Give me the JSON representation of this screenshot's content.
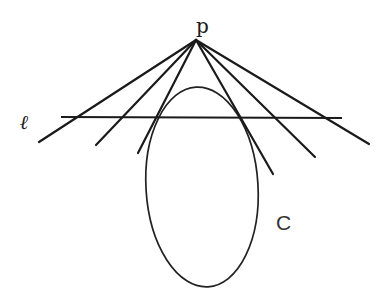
{
  "figure": {
    "labels": {
      "point": "p",
      "line": "ℓ",
      "curve": "C"
    },
    "colors": {
      "stroke": "#1a1a1a",
      "background": "#ffffff"
    }
  },
  "geometry": {
    "apex_p": {
      "x": 196,
      "y": 40
    },
    "line_l": {
      "x1": 61,
      "y1": 117,
      "x2": 342,
      "y2": 118
    },
    "rays": [
      {
        "name": "ray-1",
        "x2": 39,
        "y2": 142,
        "tangent": false
      },
      {
        "name": "ray-2",
        "x2": 96,
        "y2": 145,
        "tangent": false
      },
      {
        "name": "tangent-left",
        "x2": 138,
        "y2": 153,
        "tangent": true
      },
      {
        "name": "tangent-right",
        "x2": 273,
        "y2": 174,
        "tangent": true
      },
      {
        "name": "ray-5",
        "x2": 315,
        "y2": 157,
        "tangent": false
      },
      {
        "name": "ray-6",
        "x2": 369,
        "y2": 144,
        "tangent": false
      }
    ],
    "curve_C": {
      "cx": 202,
      "cy": 187,
      "rx": 56,
      "ry": 100,
      "rotate": -3.5
    }
  }
}
